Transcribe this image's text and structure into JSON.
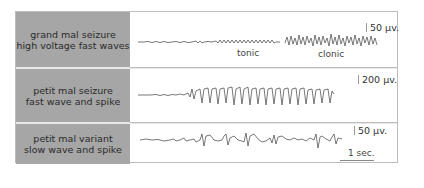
{
  "rows": [
    {
      "label_line1": "grand mal seizure",
      "label_line2": "high voltage fast waves",
      "scale": "50 µv.",
      "annotations": [
        "tonic",
        "clonic"
      ]
    },
    {
      "label_line1": "petit mal seizure",
      "label_line2": "fast wave and spike",
      "scale": "200 µv."
    },
    {
      "label_line1": "petit mal variant",
      "label_line2": "slow wave and spike",
      "scale": "50 µv.",
      "time_scale": "1 sec."
    }
  ],
  "colors": {
    "label_bg": "#a6a6a6",
    "trace": "#555555",
    "border": "#bdbdbd"
  }
}
